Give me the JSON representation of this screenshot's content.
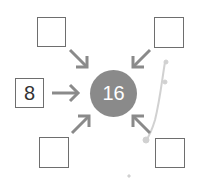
{
  "diagram": {
    "center": {
      "value": "16",
      "color": "#8a8a8a"
    },
    "boxes": [
      {
        "position": "top-left",
        "value": ""
      },
      {
        "position": "top-right",
        "value": ""
      },
      {
        "position": "left",
        "value": "8"
      },
      {
        "position": "bottom-left",
        "value": ""
      },
      {
        "position": "bottom-right",
        "value": ""
      }
    ],
    "arrow_color": "#8a8a8a"
  }
}
